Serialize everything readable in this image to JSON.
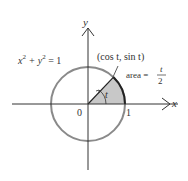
{
  "diagram": {
    "equation": {
      "lhs": "x",
      "exp1": "2",
      "plus": " + y",
      "exp2": "2",
      "rhs": " = 1"
    },
    "point_label": "(cos t, sin t)",
    "area_label": "area =",
    "area_num": "t",
    "area_den": "2",
    "angle_label": "t",
    "x_axis_label": "x",
    "y_axis_label": "y",
    "origin_label": "0",
    "one_label": "1",
    "colors": {
      "circle": "#888888",
      "sector": "#c8c8c8",
      "axis": "#333333",
      "arc": "#222222"
    }
  }
}
